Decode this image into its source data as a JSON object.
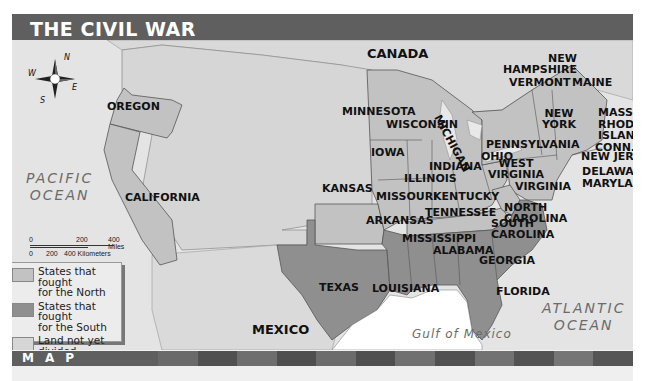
{
  "header": {
    "title": "THE CIVIL WAR"
  },
  "compass": {
    "n": "N",
    "s": "S",
    "e": "E",
    "w": "W"
  },
  "countries": {
    "canada": "CANADA",
    "mexico": "MEXICO"
  },
  "water": {
    "pacific_line1": "PACIFIC",
    "pacific_line2": "OCEAN",
    "atlantic_line1": "ATLANTIC",
    "atlantic_line2": "OCEAN",
    "gulf": "Gulf of Mexico"
  },
  "states": {
    "oregon": "OREGON",
    "california": "CALIFORNIA",
    "kansas": "KANSAS",
    "texas": "TEXAS",
    "minnesota": "MINNESOTA",
    "wisconsin": "WISCONSIN",
    "michigan": "MICHIGAN",
    "iowa": "IOWA",
    "illinois": "ILLINOIS",
    "indiana": "INDIANA",
    "ohio": "OHIO",
    "missouri": "MISSOURI",
    "kentucky": "KENTUCKY",
    "tennessee": "TENNESSEE",
    "arkansas": "ARKANSAS",
    "mississippi": "MISSISSIPPI",
    "alabama": "ALABAMA",
    "louisiana": "LOUISIANA",
    "georgia": "GEORGIA",
    "florida": "FLORIDA",
    "south_carolina_1": "SOUTH",
    "south_carolina_2": "CAROLINA",
    "north_carolina_1": "NORTH",
    "north_carolina_2": "CAROLINA",
    "virginia": "VIRGINIA",
    "west_virginia_1": "WEST",
    "west_virginia_2": "VIRGINIA",
    "pennsylvania": "PENNSYLVANIA",
    "new_york_1": "NEW",
    "new_york_2": "YORK",
    "new_hampshire_1": "NEW",
    "new_hampshire_2": "HAMPSHIRE",
    "vermont": "VERMONT",
    "maine": "MAINE",
    "mass": "MASS.",
    "rhode_island_1": "RHODE",
    "rhode_island_2": "ISLAND",
    "conn": "CONN.",
    "new_jersey": "NEW JERSEY",
    "delaware": "DELAWARE",
    "maryland": "MARYLAND"
  },
  "scale": {
    "miles": [
      "0",
      "200",
      "400 Miles"
    ],
    "km": [
      "0",
      "200",
      "400 Kilometers"
    ]
  },
  "legend": {
    "items": [
      {
        "label_1": "States that fought",
        "label_2": "for the North",
        "color": "#c2c2c2"
      },
      {
        "label_1": "States that fought",
        "label_2": "for the South",
        "color": "#8f8f8f"
      },
      {
        "label_1": "Land not yet divided",
        "label_2": "into states",
        "color": "#d6d6d6"
      }
    ]
  },
  "footer": {
    "label": "MAP WORK"
  },
  "colors": {
    "north": "#c2c2c2",
    "south": "#8f8f8f",
    "territory": "#d6d6d6",
    "water": "#e8e8e8",
    "header": "#5f5f5f"
  }
}
